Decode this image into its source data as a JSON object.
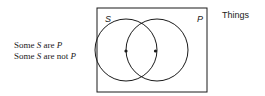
{
  "caption": {
    "line1": {
      "pre": "Some ",
      "subject": "S",
      "mid": " are ",
      "predicate": "P"
    },
    "line2": {
      "pre": "Some ",
      "subject": "S",
      "mid": " are not ",
      "predicate": "P"
    }
  },
  "diagram": {
    "universe_label": "Things",
    "set_left_label": "S",
    "set_right_label": "P",
    "marks": [
      {
        "region": "S-only",
        "symbol": "*"
      },
      {
        "region": "S-and-P",
        "symbol": "*"
      }
    ]
  },
  "colors": {
    "stroke": "#1a1a1a",
    "background": "#ffffff"
  }
}
